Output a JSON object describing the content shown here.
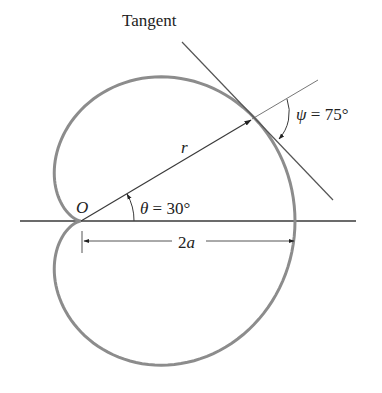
{
  "figure": {
    "labels": {
      "tangent": "Tangent",
      "r": "r",
      "origin": "O",
      "theta_symbol": "θ",
      "theta_eq": " = 30°",
      "psi_symbol": "ψ",
      "psi_eq": " = 75°",
      "two": "2",
      "a": "a"
    },
    "colors": {
      "curve": "#8c8c8c",
      "line": "#3a3a3a",
      "light_line": "#777777",
      "text": "#222222"
    }
  },
  "chart_data": {
    "type": "diagram",
    "curve": "cardioid",
    "params": {
      "origin_px": [
        81,
        221
      ],
      "scale_x": 107,
      "scale_y": 111
    },
    "theta_deg": 30,
    "psi_deg": 75,
    "annotations": [
      "Tangent",
      "r",
      "O",
      "θ = 30°",
      "ψ = 75°",
      "2a"
    ]
  }
}
